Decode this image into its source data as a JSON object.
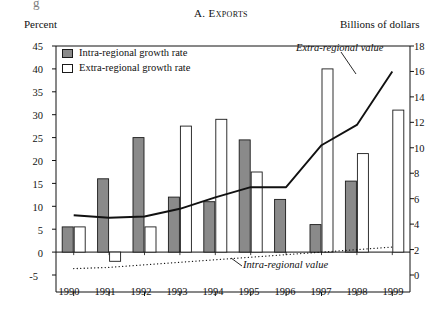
{
  "figure": {
    "partial_top_text": "g",
    "title": "A. Exports",
    "left_axis_label": "Percent",
    "right_axis_label": "Billions of dollars"
  },
  "legend": {
    "items": [
      {
        "label": "Intra-regional growth rate",
        "swatch": "filled",
        "color": "#8a8a8a"
      },
      {
        "label": "Extra-regional growth rate",
        "swatch": "open",
        "color": "#ffffff"
      }
    ]
  },
  "annotations": [
    {
      "name": "extra-regional-value",
      "text": "Extra-regional value"
    },
    {
      "name": "intra-regional-value",
      "text": "Intra-regional value"
    }
  ],
  "axes": {
    "left_ticks": [
      "45",
      "40",
      "35",
      "30",
      "25",
      "20",
      "15",
      "10",
      "5",
      "0",
      "-5"
    ],
    "right_ticks": [
      "18",
      "16",
      "14",
      "12",
      "10",
      "8",
      "6",
      "4",
      "2",
      "0"
    ],
    "x_ticks": [
      "1990",
      "1991",
      "1992",
      "1993",
      "1994",
      "1995",
      "1996",
      "1997",
      "1998",
      "1999"
    ]
  },
  "chart_data": {
    "type": "bar",
    "title": "A. Exports",
    "xlabel": "",
    "ylabel": "Percent",
    "y2label": "Billions of dollars",
    "ylim": [
      -5,
      45
    ],
    "y2lim": [
      0,
      18
    ],
    "grid": false,
    "legend_position": "top-left",
    "categories": [
      "1990",
      "1991",
      "1992",
      "1993",
      "1994",
      "1995",
      "1996",
      "1997",
      "1998",
      "1999"
    ],
    "series": [
      {
        "name": "Intra-regional growth rate",
        "kind": "bar",
        "axis": "left",
        "unit": "percent",
        "color": "#8a8a8a",
        "values": [
          5.5,
          16.0,
          25.0,
          12.0,
          11.0,
          24.5,
          11.5,
          6.0,
          15.5,
          0.0
        ]
      },
      {
        "name": "Extra-regional growth rate",
        "kind": "bar",
        "axis": "left",
        "unit": "percent",
        "color": "#ffffff",
        "values": [
          5.5,
          -2.0,
          5.5,
          27.5,
          29.0,
          17.5,
          0.0,
          40.0,
          21.5,
          31.0
        ]
      },
      {
        "name": "Extra-regional value",
        "kind": "line",
        "axis": "right",
        "unit": "billions of dollars",
        "style": "solid",
        "values": [
          4.7,
          4.5,
          4.6,
          5.2,
          6.1,
          6.9,
          6.9,
          10.2,
          11.8,
          16.0
        ]
      },
      {
        "name": "Intra-regional value",
        "kind": "line",
        "axis": "right",
        "unit": "billions of dollars",
        "style": "dotted",
        "values": [
          0.5,
          0.6,
          0.8,
          1.0,
          1.2,
          1.4,
          1.6,
          1.8,
          2.0,
          2.2
        ]
      }
    ]
  }
}
